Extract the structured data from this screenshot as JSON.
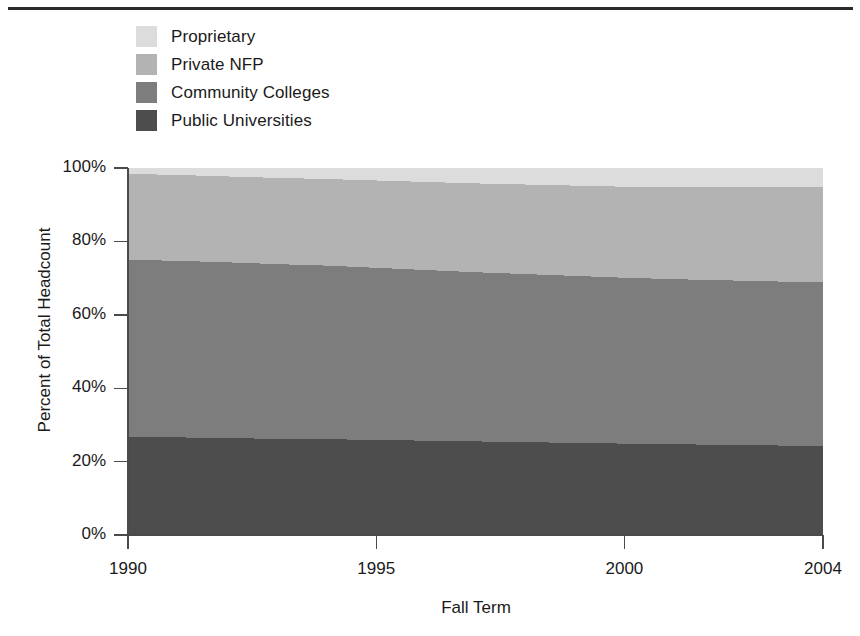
{
  "figure": {
    "has_top_rule": true,
    "background_color": "#ffffff",
    "text_color": "#1a1a1a"
  },
  "legend": {
    "position": "top-left",
    "entries": [
      {
        "label": "Proprietary",
        "color": "#dcdcdc",
        "swatch_name": "legend-swatch-proprietary"
      },
      {
        "label": "Private NFP",
        "color": "#b3b3b3",
        "swatch_name": "legend-swatch-private-nfp"
      },
      {
        "label": "Community Colleges",
        "color": "#7d7d7d",
        "swatch_name": "legend-swatch-community-colleges"
      },
      {
        "label": "Public Universities",
        "color": "#4d4d4d",
        "swatch_name": "legend-swatch-public-universities"
      }
    ]
  },
  "axes": {
    "y_title": "Percent of Total Headcount",
    "x_title": "Fall Term",
    "y_ticks": [
      "0%",
      "20%",
      "40%",
      "60%",
      "80%",
      "100%"
    ],
    "x_ticks": [
      "1990",
      "1995",
      "2000",
      "2004"
    ]
  },
  "chart_data": {
    "type": "area",
    "title": "",
    "subtitle": "",
    "xlabel": "Fall Term",
    "ylabel": "Percent of Total Headcount",
    "stacked": true,
    "normalized_percent": true,
    "grid": false,
    "legend_position": "top-left",
    "xlim": [
      1990,
      2004
    ],
    "ylim": [
      0,
      100
    ],
    "x": [
      1990,
      1991,
      1992,
      1993,
      1994,
      1995,
      1996,
      1997,
      1998,
      1999,
      2000,
      2001,
      2002,
      2003,
      2004
    ],
    "x_tick_values": [
      1990,
      1995,
      2000,
      2004
    ],
    "y_tick_values": [
      0,
      20,
      40,
      60,
      80,
      100
    ],
    "stack_order_bottom_to_top": [
      "Public Universities",
      "Community Colleges",
      "Private NFP",
      "Proprietary"
    ],
    "series": [
      {
        "name": "Public Universities",
        "color": "#4d4d4d",
        "values": [
          26.8,
          26.6,
          26.4,
          26.2,
          26.1,
          25.9,
          25.7,
          25.5,
          25.3,
          25.1,
          24.9,
          24.7,
          24.6,
          24.4,
          24.2
        ]
      },
      {
        "name": "Community Colleges",
        "color": "#7d7d7d",
        "values": [
          48.2,
          48.1,
          47.9,
          47.6,
          47.3,
          46.9,
          46.5,
          46.1,
          45.8,
          45.5,
          45.2,
          45.0,
          44.8,
          44.7,
          44.6
        ]
      },
      {
        "name": "Private NFP",
        "color": "#b3b3b3",
        "values": [
          23.4,
          23.4,
          23.4,
          23.5,
          23.6,
          23.8,
          24.0,
          24.2,
          24.4,
          24.6,
          24.8,
          25.1,
          25.4,
          25.7,
          26.1
        ]
      },
      {
        "name": "Proprietary",
        "color": "#dcdcdc",
        "values": [
          1.6,
          1.9,
          2.3,
          2.7,
          3.0,
          3.4,
          3.8,
          4.2,
          4.5,
          4.8,
          5.1,
          5.2,
          5.2,
          5.2,
          5.1
        ]
      }
    ],
    "cumulative_top_boundaries": {
      "Public Universities": [
        26.8,
        26.6,
        26.4,
        26.2,
        26.1,
        25.9,
        25.7,
        25.5,
        25.3,
        25.1,
        24.9,
        24.7,
        24.6,
        24.4,
        24.2
      ],
      "Community Colleges": [
        75.0,
        74.7,
        74.3,
        73.8,
        73.4,
        72.8,
        72.2,
        71.6,
        71.1,
        70.6,
        70.1,
        69.7,
        69.4,
        69.1,
        68.8
      ],
      "Private NFP": [
        98.4,
        98.1,
        97.7,
        97.3,
        97.0,
        96.6,
        96.2,
        95.8,
        95.5,
        95.2,
        94.9,
        94.8,
        94.8,
        94.8,
        94.9
      ],
      "Proprietary": [
        100,
        100,
        100,
        100,
        100,
        100,
        100,
        100,
        100,
        100,
        100,
        100,
        100,
        100,
        100
      ]
    }
  }
}
